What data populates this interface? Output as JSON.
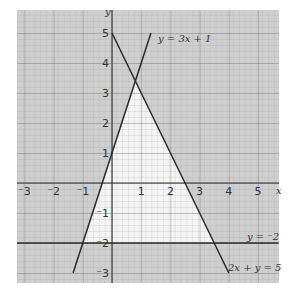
{
  "chart_data": {
    "type": "line",
    "title": "",
    "xlabel": "x",
    "ylabel": "y",
    "xlim": [
      -3.25,
      5.7
    ],
    "ylim": [
      -3.3,
      5.75
    ],
    "grid": true,
    "x_ticks": [
      -3,
      -2,
      -1,
      1,
      2,
      3,
      4,
      5
    ],
    "y_ticks": [
      5,
      4,
      3,
      2,
      1,
      -1,
      -2,
      -3
    ],
    "x_tick_labels": [
      "⁻3",
      "⁻2",
      "⁻1",
      "1",
      "2",
      "3",
      "4",
      "5"
    ],
    "y_tick_labels": [
      "5",
      "4",
      "3",
      "2",
      "1",
      "⁻1",
      "⁻2",
      "⁻3"
    ],
    "series": [
      {
        "name": "y = 3x + 1",
        "points": [
          [
            -1.333,
            -3
          ],
          [
            1.333,
            5
          ]
        ]
      },
      {
        "name": "2x + y = 5",
        "points": [
          [
            0,
            5
          ],
          [
            4,
            -3
          ]
        ]
      },
      {
        "name": "y = ⁻2",
        "points": [
          [
            -3.25,
            -2
          ],
          [
            5.7,
            -2
          ]
        ]
      }
    ],
    "unshaded_region": {
      "description": "feasible triangle (left unshaded)",
      "vertices": [
        [
          -1,
          -2
        ],
        [
          0.8,
          3.4
        ],
        [
          3.5,
          -2
        ]
      ]
    },
    "annotations": [
      {
        "text": "y = 3x + 1",
        "x": 1.45,
        "y": 4.9
      },
      {
        "text": "y = ⁻2",
        "x": 4.5,
        "y": -1.75
      },
      {
        "text": "2x + y = 5",
        "x": 3.85,
        "y": -2.8
      }
    ],
    "colors": {
      "grid_shaded": "#c8c8c8",
      "unshaded": "#f3f3f3",
      "lines": "#2a2a2a"
    }
  },
  "labels": {
    "x_axis": "x",
    "y_axis": "y",
    "eq1": "y = 3x + 1",
    "eq2": "y = ⁻2",
    "eq3": "2x + y = 5"
  }
}
